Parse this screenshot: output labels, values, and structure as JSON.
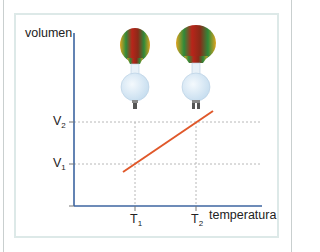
{
  "diagram": {
    "y_axis_label": "volumen",
    "x_axis_label": "temperatura",
    "y_ticks": [
      {
        "base": "V",
        "sub": "2"
      },
      {
        "base": "V",
        "sub": "1"
      }
    ],
    "x_ticks": [
      {
        "base": "T",
        "sub": "1"
      },
      {
        "base": "T",
        "sub": "2"
      }
    ],
    "colors": {
      "axis": "#3c64a0",
      "line": "#e0582a",
      "grid": "#b8b8b8",
      "frame": "#dde9e8"
    },
    "balloons": [
      {
        "label": "balloon at T1 (smaller)"
      },
      {
        "label": "balloon at T2 (larger)"
      }
    ]
  }
}
